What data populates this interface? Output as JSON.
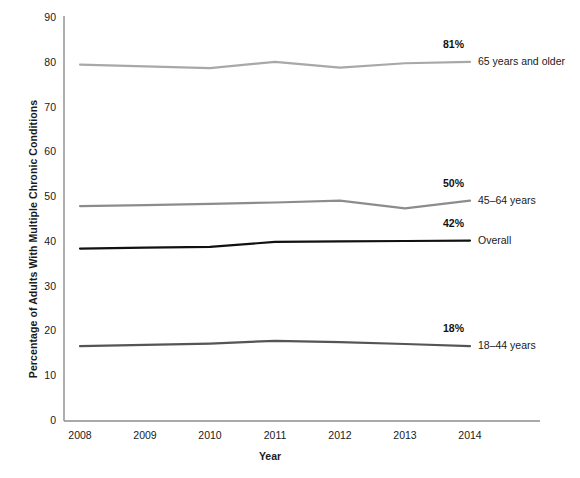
{
  "chart_data": {
    "type": "line",
    "title": "",
    "xlabel": "Year",
    "ylabel": "Percentage of Adults With Multiple Chronic Conditions",
    "categories": [
      "2008",
      "2009",
      "2010",
      "2011",
      "2012",
      "2013",
      "2014"
    ],
    "x": [
      2008,
      2009,
      2010,
      2011,
      2012,
      2013,
      2014
    ],
    "xlim": [
      2008,
      2014
    ],
    "ylim": [
      0,
      90
    ],
    "yticks": [
      0,
      10,
      20,
      30,
      40,
      50,
      60,
      70,
      80,
      90
    ],
    "ytick_labels": [
      "0",
      "10",
      "20",
      "30",
      "40",
      "50",
      "60",
      "70",
      "80",
      "90"
    ],
    "grid": false,
    "legend_position": "right-inline",
    "series": [
      {
        "name": "65 years and older",
        "values": [
          79.6,
          79.2,
          78.8,
          80.2,
          78.9,
          79.9,
          80.2
        ],
        "end_label": "81%",
        "color": "#a8a8a8",
        "line_width": 2.2
      },
      {
        "name": "45–64 years",
        "values": [
          48.0,
          48.2,
          48.5,
          48.8,
          49.2,
          47.5,
          49.2
        ],
        "end_label": "50%",
        "color": "#8c8c8c",
        "line_width": 2.2
      },
      {
        "name": "Overall",
        "values": [
          38.5,
          38.7,
          38.9,
          40.0,
          40.1,
          40.2,
          40.3
        ],
        "end_label": "42%",
        "color": "#111111",
        "line_width": 2.2
      },
      {
        "name": "18–44 years",
        "values": [
          16.7,
          17.0,
          17.3,
          17.9,
          17.6,
          17.2,
          16.7
        ],
        "end_label": "18%",
        "color": "#555555",
        "line_width": 2.2
      }
    ]
  },
  "axes": {
    "y_title": "Percentage of Adults With Multiple Chronic Conditions",
    "x_title": "Year"
  },
  "colors": {
    "axis": "#8c8c8c",
    "text": "#1a1a1a"
  }
}
